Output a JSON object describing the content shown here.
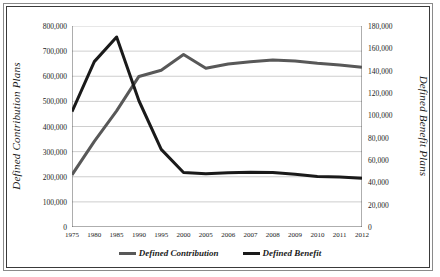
{
  "chart_data": {
    "type": "line",
    "title": "",
    "xlabel": "",
    "ylabel": "Defined Contribution Plans",
    "y2label": "Defined Benefit Plans",
    "grid": true,
    "legend_position": "bottom",
    "categories": [
      "1975",
      "1980",
      "1985",
      "1990",
      "1995",
      "2000",
      "2005",
      "2006",
      "2007",
      "2008",
      "2009",
      "2010",
      "2011",
      "2012"
    ],
    "yticks": [
      "0",
      "100,000",
      "200,000",
      "300,000",
      "400,000",
      "500,000",
      "600,000",
      "700,000",
      "800,000"
    ],
    "y2ticks": [
      "0",
      "20,000",
      "40,000",
      "60,000",
      "80,000",
      "100,000",
      "120,000",
      "140,000",
      "160,000",
      "180,000"
    ],
    "ylim": [
      0,
      800000
    ],
    "y2lim": [
      0,
      180000
    ],
    "series": [
      {
        "name": "Defined Contribution",
        "axis": "left",
        "color": "#585858",
        "values": [
          207748,
          340805,
          462312,
          599245,
          623912,
          686878,
          631481,
          649000,
          658000,
          665000,
          661000,
          652000,
          645000,
          636000
        ]
      },
      {
        "name": "Defined Benefit",
        "axis": "right",
        "color": "#1a1a1a",
        "values": [
          103346,
          148096,
          170172,
          113062,
          69492,
          48773,
          47614,
          48579,
          48982,
          48748,
          47137,
          45256,
          44869,
          43601
        ]
      }
    ]
  },
  "legend": {
    "items": [
      {
        "label": "Defined Contribution",
        "color": "#585858"
      },
      {
        "label": "Defined Benefit",
        "color": "#1a1a1a"
      }
    ]
  }
}
